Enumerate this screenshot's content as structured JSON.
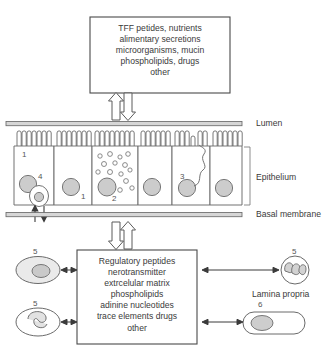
{
  "diagram": {
    "top_box": {
      "name": "luminal-contents-box",
      "lines": [
        "TFF petides, nutrients",
        "alimentary secretions",
        "microorganisms, mucin",
        "phospholipids, drugs",
        "other"
      ]
    },
    "bottom_box": {
      "name": "lamina-propria-mediators-box",
      "lines": [
        "Regulatory peptides",
        "nerotransmitter",
        "extrcelular matrix",
        "phospholipids",
        "adinine nucleotides",
        "trace elements drugs",
        "other"
      ]
    },
    "side_labels": {
      "lumen": "Lumen",
      "epithelium": "Epithelium",
      "basal_membrane": "Basal membrane",
      "lamina_propria": "Lamina propria"
    },
    "cell_numbers": {
      "enterocyte_left": "1",
      "enterocyte_second": "1",
      "goblet_cell": "2",
      "tuft_cell": "3",
      "basal_cell": "4",
      "immune_cell_top_left": "5",
      "immune_cell_bottom_left": "5",
      "granulocyte_right": "5",
      "spindle_cell_right": "6"
    },
    "colors": {
      "stroke": "#5a5a5a",
      "nucleus_fill": "#cfcfcf",
      "membrane_fill": "#d8d8d8",
      "background": "#ffffff"
    }
  }
}
